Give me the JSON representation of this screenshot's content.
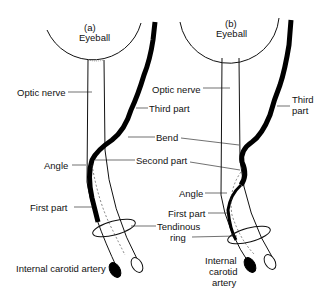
{
  "panel_a": {
    "tag": "(a)",
    "eyeball": "Eyeball",
    "optic_nerve": "Optic nerve",
    "third_part": "Third part",
    "bend": "Bend",
    "angle": "Angle",
    "second_part": "Second part",
    "first_part": "First part",
    "tendinous_ring_1": "Tendinous",
    "tendinous_ring_2": "ring",
    "ica": "Internal carotid artery"
  },
  "panel_b": {
    "tag": "(b)",
    "eyeball": "Eyeball",
    "optic_nerve": "Optic nerve",
    "third_part_1": "Third",
    "third_part_2": "part",
    "angle": "Angle",
    "first_part": "First part",
    "ica_1": "Internal",
    "ica_2": "carotid",
    "ica_3": "artery"
  }
}
